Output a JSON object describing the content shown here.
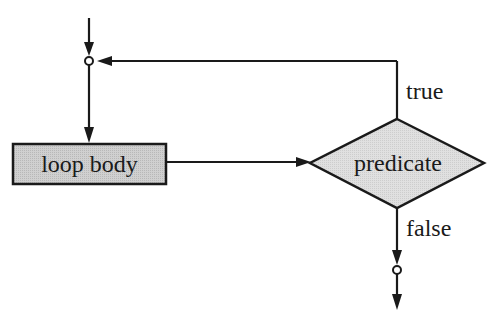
{
  "diagram": {
    "type": "flowchart",
    "nodes": {
      "loop_body": {
        "label": "loop body",
        "shape": "rectangle",
        "fill": "#c8c8c8"
      },
      "predicate": {
        "label": "predicate",
        "shape": "diamond",
        "fill": "#dcdcdc"
      }
    },
    "edges": {
      "true_label": "true",
      "false_label": "false"
    },
    "colors": {
      "stroke": "#1a1a1a",
      "background": "#ffffff"
    }
  }
}
